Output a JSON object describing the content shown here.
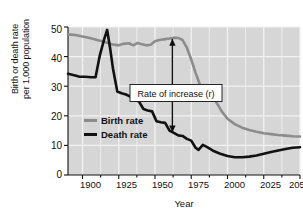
{
  "chart_data": {
    "type": "line",
    "title": "",
    "xlabel": "Year",
    "ylabel_line1": "Birth or death rate",
    "ylabel_line2": "per 1,000 population",
    "xlim": [
      1890,
      2050
    ],
    "ylim": [
      0,
      50
    ],
    "xticks": [
      1900,
      1925,
      1950,
      1975,
      2000,
      2025,
      2050
    ],
    "xticklabels": [
      "1900",
      "1925",
      "1950",
      "1975",
      "2000",
      "2025",
      "205"
    ],
    "yticks": [
      0,
      10,
      20,
      30,
      40,
      50
    ],
    "yticklabels": [
      "0",
      "10",
      "20",
      "30",
      "40",
      "50"
    ],
    "grid": true,
    "legend_position": "inner-left",
    "plot_bgcolor": "#d6d6d6",
    "gridline_color": "#f2f2f2",
    "series": [
      {
        "name": "Birth rate",
        "color": "#8c8c8c",
        "x": [
          1890,
          1895,
          1900,
          1905,
          1910,
          1915,
          1920,
          1925,
          1928,
          1932,
          1935,
          1938,
          1941,
          1944,
          1947,
          1950,
          1953,
          1957,
          1960,
          1963,
          1966,
          1969,
          1972,
          1975,
          1978,
          1981,
          1984,
          1987,
          1990,
          1993,
          1996,
          2000,
          2005,
          2010,
          2015,
          2020,
          2025,
          2030,
          2035,
          2040,
          2045,
          2050
        ],
        "y": [
          47.5,
          47.3,
          46.8,
          46.3,
          45.6,
          45.0,
          44.2,
          43.8,
          44.3,
          44.5,
          43.8,
          44.6,
          44.2,
          43.8,
          44.0,
          45.2,
          45.6,
          45.9,
          46.1,
          46.4,
          46.3,
          45.6,
          43.0,
          39.0,
          34.5,
          30.5,
          27.5,
          25.8,
          26.3,
          24.0,
          21.5,
          19.0,
          17.2,
          16.0,
          15.2,
          14.6,
          14.1,
          13.8,
          13.5,
          13.3,
          13.1,
          13.0
        ]
      },
      {
        "name": "Death rate",
        "color": "#111111",
        "x": [
          1890,
          1895,
          1898,
          1902,
          1906,
          1909,
          1912,
          1915,
          1917,
          1919,
          1921,
          1924,
          1927,
          1930,
          1933,
          1936,
          1939,
          1942,
          1945,
          1948,
          1951,
          1954,
          1957,
          1960,
          1963,
          1966,
          1969,
          1972,
          1975,
          1978,
          1980,
          1983,
          1986,
          1990,
          1995,
          2000,
          2005,
          2010,
          2015,
          2020,
          2025,
          2030,
          2035,
          2040,
          2045,
          2050
        ],
        "y": [
          34.2,
          33.6,
          33.2,
          33.2,
          33.0,
          33.0,
          40.5,
          46.0,
          49.0,
          43.0,
          36.0,
          28.2,
          27.6,
          27.2,
          26.5,
          25.3,
          24.8,
          22.3,
          21.8,
          21.5,
          18.2,
          17.8,
          17.6,
          15.0,
          14.2,
          13.4,
          13.2,
          12.2,
          11.6,
          9.2,
          8.5,
          10.2,
          9.4,
          8.2,
          7.2,
          6.4,
          6.0,
          6.0,
          6.2,
          6.6,
          7.2,
          7.8,
          8.3,
          8.8,
          9.2,
          9.4
        ]
      }
    ],
    "annotations": [
      {
        "name": "rate-of-increase",
        "text": "Rate  of increase (r)",
        "arrow_x_year": 1962,
        "arrow_y_top": 46.0,
        "arrow_y_bottom": 14.4,
        "double_headed": true
      }
    ],
    "legend": [
      {
        "label": "Birth rate",
        "color": "#8c8c8c"
      },
      {
        "label": "Death rate",
        "color": "#111111"
      }
    ]
  }
}
